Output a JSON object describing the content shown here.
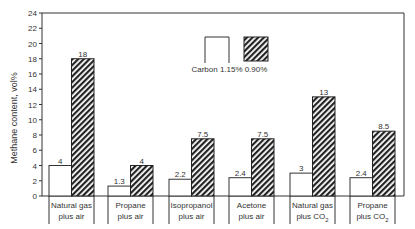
{
  "chart_data": {
    "type": "bar",
    "title": "",
    "xlabel": "",
    "ylabel": "Methane content, vol%",
    "ylim": [
      0,
      24
    ],
    "yticks": [
      0,
      2,
      4,
      6,
      8,
      10,
      12,
      14,
      16,
      18,
      20,
      22,
      24
    ],
    "grid": false,
    "legend_position": "top-center",
    "categories": [
      {
        "line1": "Natural gas",
        "line2": "plus air",
        "sub": ""
      },
      {
        "line1": "Propane",
        "line2": "plus air",
        "sub": ""
      },
      {
        "line1": "Isopropanol",
        "line2": "plus air",
        "sub": ""
      },
      {
        "line1": "Acetone",
        "line2": "plus air",
        "sub": ""
      },
      {
        "line1": "Natural gas",
        "line2": "plus CO",
        "sub": "2"
      },
      {
        "line1": "Propane",
        "line2": "plus CO",
        "sub": "2"
      }
    ],
    "series": [
      {
        "name": "Carbon 1.15%",
        "style": "open",
        "values": [
          4,
          1.3,
          2.2,
          2.4,
          3,
          2.4
        ],
        "labels": [
          "4",
          "1.3",
          "2.2",
          "2.4",
          "3",
          "2.4"
        ]
      },
      {
        "name": "0.90%",
        "style": "hatched",
        "values": [
          18,
          4,
          7.5,
          7.5,
          13,
          8.5
        ],
        "labels": [
          "18",
          "4",
          "7.5",
          "7.5",
          "13",
          "8.5"
        ]
      }
    ],
    "colors": {
      "line": "#333333",
      "bar_fill": "#ffffff",
      "hatch": "#222222"
    }
  }
}
